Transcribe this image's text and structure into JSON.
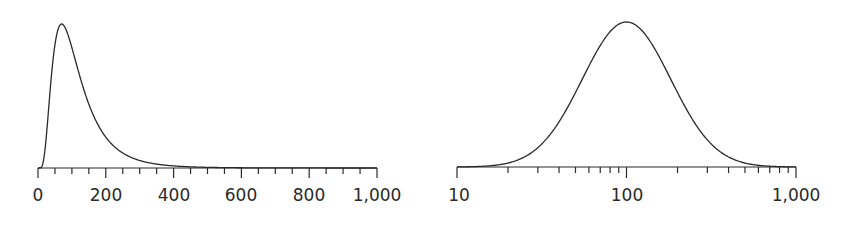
{
  "chart_data": [
    {
      "type": "line",
      "title": "",
      "description": "Log-normal density plotted on a linear x-axis (right-skewed)",
      "xlabel": "",
      "ylabel": "",
      "xscale": "linear",
      "xlim": [
        0,
        1000
      ],
      "x_ticks": [
        0,
        200,
        400,
        600,
        800,
        1000
      ],
      "x_tick_labels": [
        "0",
        "200",
        "400",
        "600",
        "800",
        "1,000"
      ],
      "minor_tick_step": 50,
      "grid": false,
      "legend": null,
      "peak_x": 100,
      "series": [
        {
          "name": "density",
          "median": 100,
          "sigma": 0.6
        }
      ]
    },
    {
      "type": "line",
      "title": "",
      "description": "Same log-normal density plotted on a logarithmic x-axis (symmetric bell)",
      "xlabel": "",
      "ylabel": "",
      "xscale": "log",
      "xlim": [
        10,
        1000
      ],
      "x_ticks": [
        10,
        100,
        1000
      ],
      "x_tick_labels": [
        "10",
        "100",
        "1,000"
      ],
      "minor_ticks": [
        20,
        30,
        40,
        50,
        60,
        70,
        80,
        90,
        200,
        300,
        400,
        500,
        600,
        700,
        800,
        900
      ],
      "grid": false,
      "legend": null,
      "peak_x": 100,
      "series": [
        {
          "name": "density",
          "median": 100,
          "sigma": 0.6
        }
      ]
    }
  ],
  "left": {
    "labels": [
      "0",
      "200",
      "400",
      "600",
      "800",
      "1,000"
    ]
  },
  "right": {
    "labels": [
      "10",
      "100",
      "1,000"
    ]
  }
}
